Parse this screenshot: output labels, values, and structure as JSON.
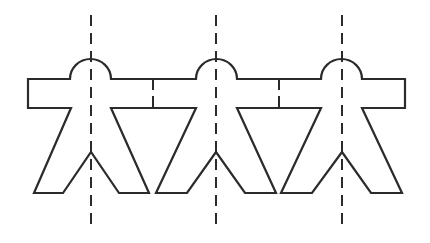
{
  "diagram": {
    "title": "",
    "figure_count": 3,
    "colors": {
      "line": "#2b2b2b",
      "background": "#ffffff"
    },
    "figures": [
      {
        "name": "figure-1",
        "center_x": 91
      },
      {
        "name": "figure-2",
        "center_x": 216
      },
      {
        "name": "figure-3",
        "center_x": 342
      }
    ],
    "fold_lines": [
      {
        "name": "fold-line-1",
        "x": 91
      },
      {
        "name": "fold-line-2",
        "x": 216
      },
      {
        "name": "fold-line-3",
        "x": 342
      }
    ],
    "joints": [
      {
        "name": "joint-1-2",
        "x": 153
      },
      {
        "name": "joint-2-3",
        "x": 279
      }
    ]
  }
}
